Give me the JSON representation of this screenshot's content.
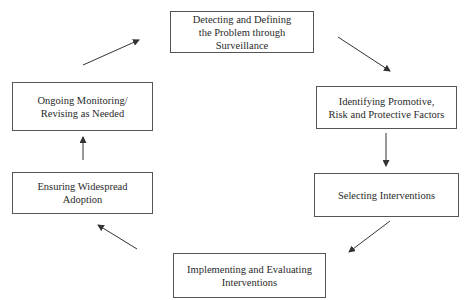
{
  "diagram": {
    "type": "cycle",
    "nodes": [
      {
        "id": "detect",
        "lines": [
          "Detecting and Defining",
          "the Problem through Surveillance"
        ]
      },
      {
        "id": "identify",
        "lines": [
          "Identifying Promotive,",
          "Risk and Protective Factors"
        ]
      },
      {
        "id": "select",
        "lines": [
          "Selecting Interventions"
        ]
      },
      {
        "id": "implement",
        "lines": [
          "Implementing and Evaluating",
          "Interventions"
        ]
      },
      {
        "id": "adopt",
        "lines": [
          "Ensuring Widespread Adoption"
        ]
      },
      {
        "id": "monitor",
        "lines": [
          "Ongoing Monitoring/",
          "Revising as Needed"
        ]
      }
    ],
    "edges": [
      {
        "from": "detect",
        "to": "identify"
      },
      {
        "from": "identify",
        "to": "select"
      },
      {
        "from": "select",
        "to": "implement"
      },
      {
        "from": "implement",
        "to": "adopt"
      },
      {
        "from": "adopt",
        "to": "monitor"
      },
      {
        "from": "monitor",
        "to": "detect"
      }
    ],
    "colors": {
      "line": "#333333",
      "border": "#555555",
      "background": "#ffffff"
    }
  }
}
